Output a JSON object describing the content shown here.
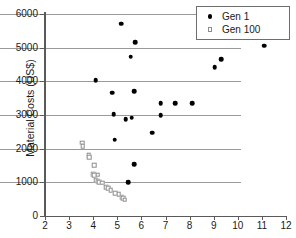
{
  "chart_data": {
    "type": "scatter",
    "title": "",
    "xlabel": "",
    "ylabel": "Material Costs (US$)",
    "xlim": [
      2,
      12
    ],
    "ylim": [
      0,
      6000
    ],
    "xticks": [
      2,
      3,
      4,
      5,
      6,
      7,
      8,
      9,
      10,
      11,
      12
    ],
    "yticks": [
      0,
      1000,
      2000,
      3000,
      4000,
      5000,
      6000
    ],
    "grid": "horizontal",
    "legend_position": "top-right",
    "colors": {
      "gen1": "#000000",
      "gen100": "#8d8d8d",
      "gridline": "#9a9a9a",
      "axis": "#5a5a5a"
    },
    "series": [
      {
        "name": "Gen 1",
        "marker": "filled-circle",
        "points": [
          [
            5.15,
            5715
          ],
          [
            5.75,
            5170
          ],
          [
            5.55,
            4730
          ],
          [
            11.1,
            5060
          ],
          [
            9.3,
            4665
          ],
          [
            9.05,
            4420
          ],
          [
            4.1,
            4035
          ],
          [
            5.7,
            3705
          ],
          [
            4.8,
            3660
          ],
          [
            6.8,
            3350
          ],
          [
            7.4,
            3355
          ],
          [
            8.1,
            3350
          ],
          [
            6.8,
            2995
          ],
          [
            5.6,
            2920
          ],
          [
            4.85,
            3030
          ],
          [
            5.35,
            2870
          ],
          [
            6.45,
            2480
          ],
          [
            4.9,
            2265
          ],
          [
            5.7,
            1545
          ],
          [
            5.45,
            1010
          ]
        ]
      },
      {
        "name": "Gen 100",
        "marker": "open-square",
        "points": [
          [
            3.55,
            2180
          ],
          [
            3.57,
            2075
          ],
          [
            3.82,
            1800
          ],
          [
            3.84,
            1755
          ],
          [
            4.05,
            1505
          ],
          [
            4.0,
            1235
          ],
          [
            4.05,
            1215
          ],
          [
            4.18,
            1225
          ],
          [
            4.1,
            1060
          ],
          [
            4.18,
            1030
          ],
          [
            4.25,
            1000
          ],
          [
            4.38,
            985
          ],
          [
            4.55,
            855
          ],
          [
            4.62,
            830
          ],
          [
            4.72,
            760
          ],
          [
            4.92,
            685
          ],
          [
            5.05,
            640
          ],
          [
            5.18,
            560
          ],
          [
            5.25,
            525
          ],
          [
            5.3,
            480
          ]
        ]
      }
    ]
  },
  "legend": {
    "entries": [
      {
        "label": "Gen 1",
        "marker": "filled-circle"
      },
      {
        "label": "Gen 100",
        "marker": "open-square"
      }
    ]
  }
}
